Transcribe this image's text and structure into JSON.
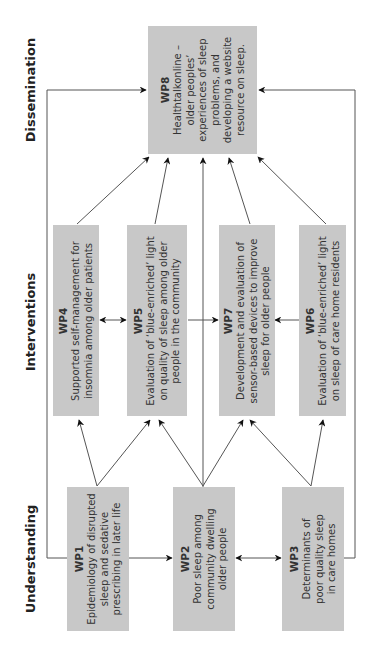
{
  "stages": [
    {
      "label": "Dissemination"
    },
    {
      "label": "Interventions"
    },
    {
      "label": "Understanding"
    }
  ],
  "work_packages": {
    "wp8": {
      "id": "WP8",
      "lines": [
        "Healthtalkonline –",
        "older peoples’",
        "experiences of sleep",
        "problems, and",
        "developing a website",
        "resource on sleep."
      ]
    },
    "wp4": {
      "id": "WP4",
      "lines": [
        "Supported self-management for",
        "insomnia among older patients"
      ]
    },
    "wp5": {
      "id": "WP5",
      "lines": [
        "Evaluation of ‘blue-enriched’ light",
        "on quality of sleep among older",
        "people in the community"
      ]
    },
    "wp7": {
      "id": "WP7",
      "lines": [
        "Development and evaluation of",
        "sensor-based devices to improve",
        "sleep for older people"
      ]
    },
    "wp6": {
      "id": "WP6",
      "lines": [
        "Evaluation of ‘blue-enriched’ light",
        "on sleep of care home residents"
      ]
    },
    "wp1": {
      "id": "WP1",
      "lines": [
        "Epidemiology of disrupted",
        "sleep and sedative",
        "prescribing in later life"
      ]
    },
    "wp2": {
      "id": "WP2",
      "lines": [
        "Poor sleep among",
        "community dwelling",
        "older people"
      ]
    },
    "wp3": {
      "id": "WP3",
      "lines": [
        "Determinants of",
        "poor quality sleep",
        "in care homes"
      ]
    }
  },
  "colors": {
    "box": "#c8c8c8",
    "line": "#555555",
    "arrow": "#111111"
  }
}
